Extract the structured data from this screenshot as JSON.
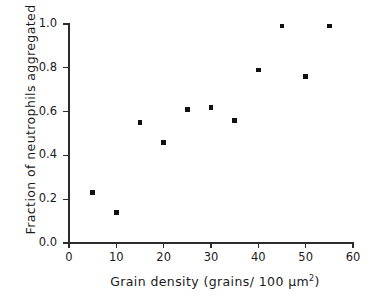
{
  "chart_data": {
    "type": "scatter",
    "title": "",
    "xlabel": "Grain density (grains/ 100 µm2)",
    "xlabel_main": "Grain density (grains/ 100 µm",
    "xlabel_sup": "2",
    "xlabel_tail": ")",
    "ylabel": "Fraction of neutrophils aggregated",
    "xlim": [
      0,
      60
    ],
    "ylim": [
      0.0,
      1.0
    ],
    "xticks": [
      "0",
      "10",
      "20",
      "30",
      "40",
      "50",
      "60"
    ],
    "xtick_values": [
      0,
      10,
      20,
      30,
      40,
      50,
      60
    ],
    "yticks": [
      "0.0",
      "0.2",
      "0.4",
      "0.6",
      "0.8",
      "1.0"
    ],
    "ytick_values": [
      0.0,
      0.2,
      0.4,
      0.6,
      0.8,
      1.0
    ],
    "grid": false,
    "legend": false,
    "marker": "square",
    "marker_color": "#111111",
    "axis_color": "#2b2b2b",
    "background": "#ffffff",
    "x": [
      5,
      10,
      15,
      20,
      25,
      30,
      35,
      40,
      45,
      50,
      55
    ],
    "y": [
      0.23,
      0.14,
      0.55,
      0.46,
      0.61,
      0.62,
      0.56,
      0.79,
      0.99,
      0.76,
      0.99
    ],
    "points": [
      {
        "x": 5,
        "y": 0.23
      },
      {
        "x": 10,
        "y": 0.14
      },
      {
        "x": 15,
        "y": 0.55
      },
      {
        "x": 20,
        "y": 0.46
      },
      {
        "x": 25,
        "y": 0.61
      },
      {
        "x": 30,
        "y": 0.62
      },
      {
        "x": 35,
        "y": 0.56
      },
      {
        "x": 40,
        "y": 0.79
      },
      {
        "x": 45,
        "y": 0.99
      },
      {
        "x": 50,
        "y": 0.76
      },
      {
        "x": 55,
        "y": 0.99
      }
    ]
  }
}
